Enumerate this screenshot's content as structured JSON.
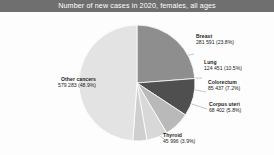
{
  "header": {
    "title": "Number of new cases in 2020, females, all ages"
  },
  "chart_data": {
    "type": "pie",
    "title": "Number of new cases in 2020, females, all ages",
    "subtitle": "",
    "xlabel": "",
    "ylabel": "",
    "legend_position": "none",
    "grid": false,
    "total_label": "",
    "categories": [
      "Breast",
      "Lung",
      "Colorectum",
      "Corpus uteri",
      "Thyroid",
      "Other cancers"
    ],
    "values": [
      2261419,
      770828,
      865630,
      417367,
      448915,
      4573791
    ],
    "labels": [
      "281 591",
      "124 451",
      "85 437",
      "68 402",
      "45 996",
      "579 283"
    ],
    "percents": [
      23.8,
      10.5,
      7.2,
      5.8,
      3.9,
      48.9
    ],
    "percent_labels": [
      "(23.8%)",
      "(10.5%)",
      "(7.2%)",
      "(5.8%)",
      "(3.9%)",
      "(48.9%)"
    ],
    "colors": [
      "#8e8e8e",
      "#4f4f4f",
      "#b9b9b9",
      "#d8d8d8",
      "#cfcfcf",
      "#e3e3e3"
    ],
    "slices": [
      {
        "name": "Breast",
        "value_label": "281 591",
        "percent_label": "(23.8%)",
        "percent": 23.8,
        "color": "#8e8e8e"
      },
      {
        "name": "Lung",
        "value_label": "124 451",
        "percent_label": "(10.5%)",
        "percent": 10.5,
        "color": "#4f4f4f"
      },
      {
        "name": "Colorectum",
        "value_label": "85 437",
        "percent_label": "(7.2%)",
        "percent": 7.2,
        "color": "#b9b9b9"
      },
      {
        "name": "Corpus uteri",
        "value_label": "68 402",
        "percent_label": "(5.8%)",
        "percent": 5.8,
        "color": "#d8d8d8"
      },
      {
        "name": "Thyroid",
        "value_label": "45 996",
        "percent_label": "(3.9%)",
        "percent": 3.9,
        "color": "#cfcfcf"
      },
      {
        "name": "Other cancers",
        "value_label": "579 283",
        "percent_label": "(48.9%)",
        "percent": 48.9,
        "color": "#e3e3e3"
      }
    ]
  },
  "labels": {
    "breast": {
      "name": "Breast",
      "value": "281 591 (23.8%)"
    },
    "lung": {
      "name": "Lung",
      "value": "124 451 (10.5%)"
    },
    "colorectum": {
      "name": "Colorectum",
      "value": "85 437 (7.2%)"
    },
    "corpus_uteri": {
      "name": "Corpus uteri",
      "value": "68 402 (5.8%)"
    },
    "thyroid": {
      "name": "Thyroid",
      "value": "45 996 (3.9%)"
    },
    "other": {
      "name": "Other cancers",
      "value": "579 283 (48.9%)"
    }
  },
  "theme": {
    "header_bg": "#6f6f6f",
    "header_fg": "#ffffff",
    "page_bg": "#fdfdfd",
    "text": "#1a1a1a",
    "leader_line": "#9a9a9a",
    "slice_border": "#ffffff"
  }
}
